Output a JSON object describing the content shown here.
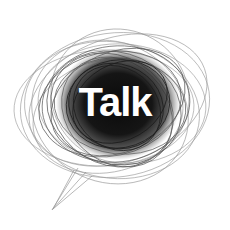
{
  "illustration": {
    "label": "Talk",
    "icon": "scribbled-speech-bubble-icon",
    "colors": {
      "background": "#ffffff",
      "scribble_dark": "#111111",
      "scribble_light": "#9a9a9a",
      "label": "#ffffff"
    }
  }
}
